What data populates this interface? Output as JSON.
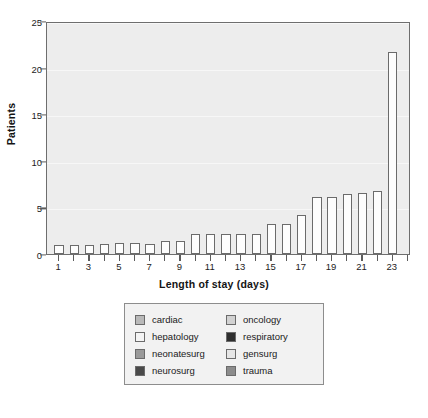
{
  "chart_data": {
    "type": "bar",
    "title": "",
    "xlabel": "Length of stay (days)",
    "ylabel": "Patients",
    "xlim": [
      0.2,
      24.2
    ],
    "ylim": [
      0,
      25
    ],
    "yticks": [
      0,
      5,
      10,
      15,
      20,
      25
    ],
    "xticks": [
      1,
      2,
      3,
      4,
      5,
      6,
      7,
      8,
      9,
      10,
      11,
      12,
      13,
      14,
      15,
      16,
      17,
      18,
      19,
      20,
      21,
      22,
      23,
      24
    ],
    "xtick_labels_shown": [
      1,
      3,
      5,
      7,
      9,
      11,
      13,
      15,
      17,
      19,
      21,
      23
    ],
    "grid": "horizontal",
    "legend_position": "below-plot",
    "categories": [
      1,
      2,
      3,
      4,
      5,
      6,
      7,
      8,
      9,
      10,
      11,
      12,
      13,
      14,
      15,
      16,
      17,
      18,
      19,
      20,
      21,
      22,
      23
    ],
    "values": [
      1.0,
      1.0,
      1.0,
      1.1,
      1.2,
      1.2,
      1.1,
      1.4,
      1.4,
      2.1,
      2.1,
      2.1,
      2.2,
      2.2,
      3.2,
      3.2,
      4.2,
      6.1,
      6.1,
      6.4,
      6.6,
      6.8,
      21.7
    ],
    "bar_facecolor": "#fdfdfd",
    "bar_edgecolor": "#6b6b6b",
    "plot_background": "#ededed",
    "axis_color": "#6e6e6e"
  },
  "axes": {
    "y_title": "Patients",
    "x_title": "Length of stay (days)",
    "y_tick_labels": [
      "0",
      "5",
      "10",
      "15",
      "20",
      "25"
    ],
    "x_tick_labels": [
      "1",
      "3",
      "5",
      "7",
      "9",
      "11",
      "13",
      "15",
      "17",
      "19",
      "21",
      "23"
    ]
  },
  "legend": {
    "items": [
      {
        "label": "cardiac",
        "color": "#b9b9b9"
      },
      {
        "label": "oncology",
        "color": "#d2d2d2"
      },
      {
        "label": "hepatology",
        "color": "#f4f4f4"
      },
      {
        "label": "respiratory",
        "color": "#2e2e2e"
      },
      {
        "label": "neonatesurg",
        "color": "#9a9a9a"
      },
      {
        "label": "gensurg",
        "color": "#e6e6e6"
      },
      {
        "label": "neurosurg",
        "color": "#4a4a4a"
      },
      {
        "label": "trauma",
        "color": "#8c8c8c"
      }
    ]
  }
}
